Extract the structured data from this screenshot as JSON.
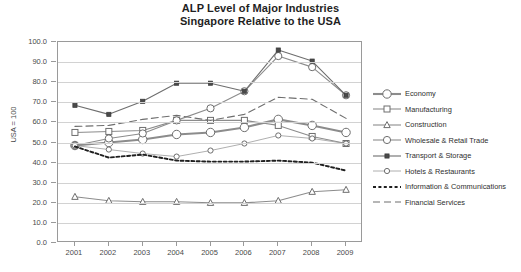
{
  "chart_data": {
    "type": "line",
    "title": "ALP Level of Major Industries",
    "subtitle": "Singapore Relative to the USA",
    "xlabel": "",
    "ylabel": "USA = 100",
    "x": [
      2001,
      2002,
      2003,
      2004,
      2005,
      2006,
      2007,
      2008,
      2009
    ],
    "xticklabels": [
      "2001",
      "2002",
      "2003",
      "2004",
      "2005",
      "2006",
      "2007",
      "2008",
      "2009"
    ],
    "yticklabels": [
      "0.0",
      "10.0",
      "20.0",
      "30.0",
      "40.0",
      "50.0",
      "60.0",
      "70.0",
      "80.0",
      "90.0",
      "100.0"
    ],
    "ylim": [
      0,
      100
    ],
    "ytick_step": 10,
    "grid": true,
    "legend_position": "right",
    "series": [
      {
        "name": "Economy",
        "marker": "circle-open-large",
        "linestyle": "solid",
        "color": "#8c8c8c",
        "values": [
          48.5,
          50.0,
          51.5,
          54.0,
          55.0,
          57.5,
          61.5,
          58.5,
          55.0
        ]
      },
      {
        "name": "Manufacturing",
        "marker": "square-open",
        "linestyle": "solid",
        "color": "#8c8c8c",
        "values": [
          55.0,
          55.5,
          56.0,
          61.0,
          61.0,
          61.0,
          58.5,
          53.0,
          49.5
        ]
      },
      {
        "name": "Construction",
        "marker": "triangle-open",
        "linestyle": "solid",
        "color": "#8c8c8c",
        "values": [
          23.0,
          21.0,
          20.5,
          20.5,
          20.0,
          20.0,
          21.0,
          25.5,
          26.5
        ]
      },
      {
        "name": "Wholesale & Retail Trade",
        "marker": "circle-open-medium",
        "linestyle": "solid",
        "color": "#8c8c8c",
        "values": [
          48.5,
          52.0,
          54.5,
          61.0,
          67.0,
          75.5,
          93.0,
          87.5,
          73.5
        ]
      },
      {
        "name": "Transport & Storage",
        "marker": "square-filled",
        "linestyle": "solid",
        "color": "#6e6e6e",
        "values": [
          68.5,
          64.0,
          70.5,
          79.5,
          79.5,
          75.5,
          96.0,
          90.5,
          73.5
        ]
      },
      {
        "name": "Hotels & Restaurants",
        "marker": "circle-open-small",
        "linestyle": "solid",
        "color": "#9a9a9a",
        "values": [
          48.5,
          46.5,
          44.5,
          43.0,
          46.0,
          49.5,
          53.5,
          52.0,
          49.5
        ]
      },
      {
        "name": "Information & Communications",
        "marker": "none",
        "linestyle": "dotted",
        "color": "#1f1f1f",
        "values": [
          48.0,
          42.5,
          44.0,
          41.0,
          40.5,
          40.5,
          41.0,
          40.0,
          36.0
        ]
      },
      {
        "name": "Financial Services",
        "marker": "none",
        "linestyle": "dashed",
        "color": "#6e6e6e",
        "values": [
          58.0,
          58.5,
          61.5,
          63.5,
          61.0,
          64.0,
          72.5,
          71.5,
          62.0
        ]
      }
    ]
  }
}
